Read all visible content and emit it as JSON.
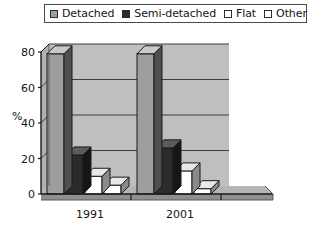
{
  "legend": {
    "entries": [
      {
        "label": "Detached",
        "swatch": "#9e9e9e"
      },
      {
        "label": "Semi-detached",
        "swatch": "#2b2b2b"
      },
      {
        "label": "Flat",
        "swatch": "#ffffff"
      },
      {
        "label": "Other",
        "swatch": "#ffffff"
      }
    ]
  },
  "axis": {
    "y_title": "%",
    "y_ticks": [
      "0",
      "20",
      "40",
      "60",
      "80"
    ],
    "x_ticks": [
      "1991",
      "2001"
    ]
  },
  "colors": {
    "plot_background": "#bfbfbf",
    "floor": "#a8a8a8",
    "gridline": "#3d3d3d",
    "axis": "#1a1a1a",
    "detached_face": "#9e9e9e",
    "detached_side": "#4f4f4f",
    "detached_top": "#c9c9c9",
    "semi_face": "#2b2b2b",
    "semi_side": "#161616",
    "semi_top": "#5c5c5c",
    "flat_face": "#ffffff",
    "flat_side": "#8a8a8a",
    "flat_top": "#e8e8e8",
    "other_face": "#ffffff",
    "other_side": "#8a8a8a",
    "other_top": "#e8e8e8"
  },
  "chart_data": {
    "type": "bar",
    "title": "",
    "xlabel": "",
    "ylabel": "%",
    "ylim": [
      0,
      80
    ],
    "grid": true,
    "legend_position": "top",
    "categories": [
      "1991",
      "2001"
    ],
    "series": [
      {
        "name": "Detached",
        "values": [
          79,
          79
        ]
      },
      {
        "name": "Semi-detached",
        "values": [
          22,
          26
        ]
      },
      {
        "name": "Flat",
        "values": [
          10,
          13
        ]
      },
      {
        "name": "Other",
        "values": [
          5,
          3
        ]
      }
    ]
  }
}
